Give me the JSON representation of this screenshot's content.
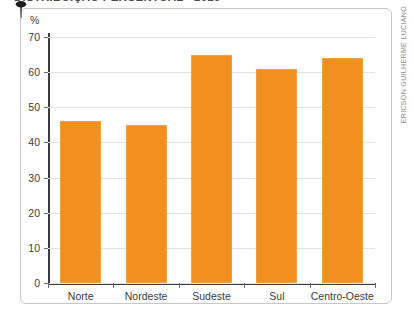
{
  "title": "DISTRIBUIÇÃO PERCENTUAL - 2010",
  "credit": "ERICSON GUILHERME LUCIANO",
  "colors": {
    "bar": "#F2901F",
    "bar_border": "#EFA245",
    "axis": "#3C3C3C",
    "grid": "#E2E2E2",
    "card_border": "#C8C8C8"
  },
  "chart_data": {
    "type": "bar",
    "title": "DISTRIBUIÇÃO PERCENTUAL - 2010",
    "categories": [
      "Norte",
      "Nordeste",
      "Sudeste",
      "Sul",
      "Centro-Oeste"
    ],
    "values": [
      46,
      45,
      65,
      61,
      64
    ],
    "xlabel": "",
    "ylabel": "%",
    "yunit": "%",
    "ylim": [
      0,
      70
    ],
    "yticks": [
      0,
      10,
      20,
      30,
      40,
      50,
      60,
      70
    ],
    "ytick_labels": [
      "0",
      "10",
      "20",
      "30",
      "40",
      "50",
      "60",
      "70"
    ],
    "grid": true,
    "grid_axis": "y",
    "legend": false,
    "legend_position": "none",
    "series": [
      {
        "name": "Percentual",
        "values": [
          46,
          45,
          65,
          61,
          64
        ]
      }
    ]
  }
}
